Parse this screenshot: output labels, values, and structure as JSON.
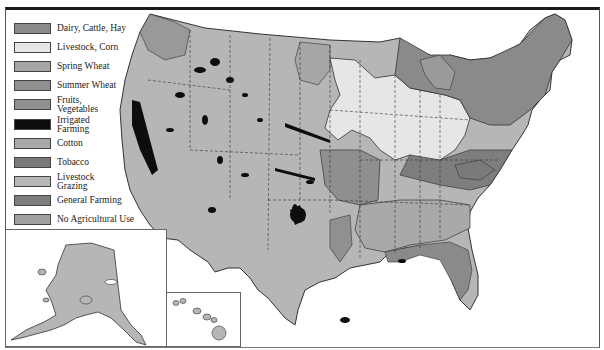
{
  "map": {
    "title": "",
    "legend": [
      {
        "label": "Dairy, Cattle, Hay",
        "color": "#8a8a8a",
        "top": 0
      },
      {
        "label": "Livestock, Corn",
        "color": "#e6e6e6",
        "top": 19
      },
      {
        "label": "Spring Wheat",
        "color": "#a6a6a6",
        "top": 38
      },
      {
        "label": "Summer Wheat",
        "color": "#8f8f8f",
        "top": 57
      },
      {
        "label": "Fruits,\nVegetables",
        "color": "#909090",
        "top": 76
      },
      {
        "label": "Irrigated\nFarming",
        "color": "#0d0d0d",
        "top": 96
      },
      {
        "label": "Cotton",
        "color": "#a9a9a9",
        "top": 115
      },
      {
        "label": "Tobacco",
        "color": "#7a7a7a",
        "top": 134
      },
      {
        "label": "Livestock\nGrazing",
        "color": "#b6b6b6",
        "top": 153
      },
      {
        "label": "General Farming",
        "color": "#7e7e7e",
        "top": 172
      },
      {
        "label": "No Agricultural Use",
        "color": "#a0a0a0",
        "top": 191
      }
    ],
    "insets": [
      {
        "name": "Alaska",
        "left": 5,
        "top": 229,
        "width": 162,
        "height": 117
      },
      {
        "name": "Hawaii",
        "left": 166,
        "top": 292,
        "width": 75,
        "height": 54
      }
    ],
    "colors": {
      "grazing": "#b6b6b6",
      "corn": "#e6e6e6",
      "dairy": "#8a8a8a",
      "general": "#7e7e7e",
      "cotton": "#a9a9a9",
      "irrigated": "#0d0d0d",
      "wheat": "#8f8f8f",
      "outline": "#333333"
    }
  }
}
